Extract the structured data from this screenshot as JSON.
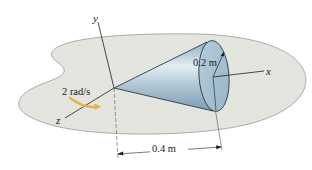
{
  "diagram": {
    "type": "rigid-body-kinematics",
    "axes": {
      "y": {
        "label": "y"
      },
      "x": {
        "label": "x"
      },
      "z": {
        "label": "z"
      }
    },
    "annotations": {
      "angular_velocity": "2 rad/s",
      "radius": "0.2 m",
      "length": "0.4 m"
    },
    "colors": {
      "platform_fill": "#e4e5df",
      "platform_edge": "#9a9a94",
      "cone_light": "#dfeaf1",
      "cone_mid": "#a9c3d3",
      "cone_dark": "#7b9cb2",
      "base_face": "#a8c1d1",
      "rotation_arrow": "#e3b24a",
      "line": "#1e1e1e"
    }
  }
}
